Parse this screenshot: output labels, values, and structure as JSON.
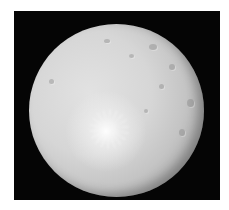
{
  "image": {
    "subject": "cratered icy moon",
    "background_color": "#050505",
    "border_color": "#ffffff",
    "moon_color": "#d6d6d6",
    "bright_spot_color": "#ffffff"
  }
}
